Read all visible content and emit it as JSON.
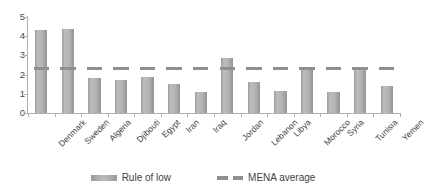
{
  "chart_data": {
    "type": "bar",
    "title": "",
    "xlabel": "",
    "ylabel": "",
    "ylim": [
      0,
      5
    ],
    "yticks": [
      0,
      1,
      2,
      3,
      4,
      5
    ],
    "grid": false,
    "legend_position": "bottom",
    "categories": [
      "Denmark",
      "Sweden",
      "Algeria",
      "Djibouti",
      "Egypt",
      "Iran",
      "Iraq",
      "Jordan",
      "Lebanon",
      "Libya",
      "Morocco",
      "Syria",
      "Tunisia",
      "Yemen"
    ],
    "series": [
      {
        "name": "Rule of low",
        "type": "bar",
        "color": "#b0b0b0",
        "values": [
          4.3,
          4.35,
          1.8,
          1.7,
          1.9,
          1.5,
          1.1,
          2.85,
          1.6,
          1.15,
          2.3,
          1.1,
          2.3,
          1.4
        ]
      },
      {
        "name": "MENA average",
        "type": "line",
        "style": "dashed",
        "color": "#8f8f8f",
        "value": 2.3
      }
    ]
  },
  "legend": {
    "items": [
      {
        "label": "Rule of low",
        "swatch": "bar-swatch"
      },
      {
        "label": "MENA average",
        "swatch": "dashed-line-swatch"
      }
    ]
  },
  "axis": {
    "y_tick_labels": [
      "5",
      "4",
      "3",
      "2",
      "1",
      "0"
    ]
  }
}
